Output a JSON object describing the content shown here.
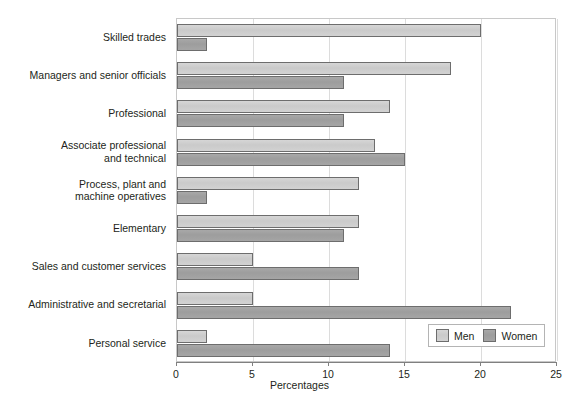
{
  "chart_data": {
    "type": "bar",
    "orientation": "horizontal",
    "title": "",
    "xlabel": "Percentages",
    "ylabel": "",
    "xlim": [
      0,
      25
    ],
    "xticks": [
      0,
      5,
      10,
      15,
      20,
      25
    ],
    "xticklabels": [
      "0",
      "5",
      "10",
      "15",
      "20",
      "25"
    ],
    "grid": "vertical",
    "legend_position": "bottom-right",
    "categories": [
      "Skilled trades",
      "Managers and senior officials",
      "Professional",
      "Associate professional\nand technical",
      "Process, plant and\nmachine operatives",
      "Elementary",
      "Sales and customer services",
      "Administrative and secretarial",
      "Personal service"
    ],
    "series": [
      {
        "name": "Men",
        "color": "#cccccc",
        "values": [
          20,
          18,
          14,
          13,
          12,
          12,
          5,
          5,
          2
        ]
      },
      {
        "name": "Women",
        "color": "#a0a0a0",
        "values": [
          2,
          11,
          11,
          15,
          2,
          11,
          12,
          22,
          14
        ]
      }
    ]
  },
  "legend": {
    "entries": [
      {
        "label": "Men"
      },
      {
        "label": "Women"
      }
    ]
  },
  "colors": {
    "men_bar": "#cccccc",
    "women_bar": "#a0a0a0",
    "bar_outline": "#6d6d6d",
    "gridline": "#dcdcdc",
    "axis": "#808080",
    "text": "#231f20"
  }
}
